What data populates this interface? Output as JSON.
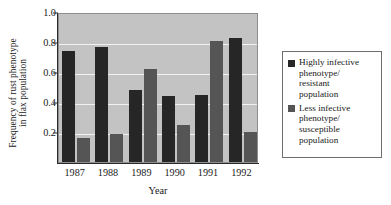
{
  "chart_data": {
    "type": "bar",
    "title": "",
    "xlabel": "Year",
    "ylabel_line1": "Frequency of rust phenotype",
    "ylabel_line2": "in flax population",
    "categories": [
      "1987",
      "1988",
      "1989",
      "1990",
      "1991",
      "1992"
    ],
    "ylim": [
      0,
      1.0
    ],
    "yticks": [
      0.2,
      0.4,
      0.6,
      0.8,
      1.0
    ],
    "ytick_labels": [
      "0.2",
      "0.4",
      "0.6",
      "0.8",
      "1.0"
    ],
    "grid": true,
    "grid_color": "#f2f2f2",
    "plot_background": "#c3c3c3",
    "legend_position": "right-outside",
    "series": [
      {
        "name": "Highly infective\nphenotype/\nresistant\npopulation",
        "color": "#262626",
        "values": [
          0.74,
          0.77,
          0.48,
          0.44,
          0.45,
          0.83
        ]
      },
      {
        "name": "Less infective\nphenotype/\nsusceptible\npopulation",
        "color": "#555555",
        "values": [
          0.16,
          0.19,
          0.62,
          0.25,
          0.81,
          0.2
        ]
      }
    ]
  }
}
